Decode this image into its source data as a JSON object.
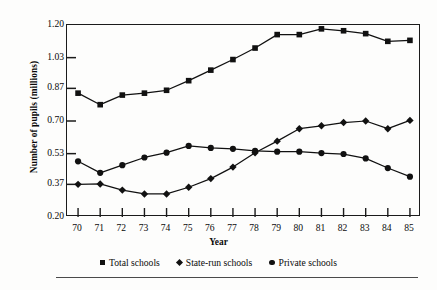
{
  "figure": {
    "ylabel": "Number of pupils (millions)",
    "xlabel": "Year"
  },
  "legend": [
    {
      "label": "Total schools",
      "marker": "square-marker-icon",
      "color": "#111111"
    },
    {
      "label": "State-run schools",
      "marker": "diamond-marker-icon",
      "color": "#111111"
    },
    {
      "label": "Private schools",
      "marker": "circle-marker-icon",
      "color": "#111111"
    }
  ],
  "axis": {
    "yticks": [
      "1.20",
      "1.03",
      "0.87",
      "0.70",
      "0.53",
      "0.37",
      "0.20"
    ],
    "ytick_values": [
      1.2,
      1.03,
      0.87,
      0.7,
      0.53,
      0.37,
      0.2
    ],
    "xticks": [
      "70",
      "71",
      "72",
      "73",
      "74",
      "75",
      "76",
      "77",
      "78",
      "79",
      "80",
      "81",
      "82",
      "83",
      "84",
      "85"
    ]
  },
  "chart_data": {
    "type": "line",
    "title": "",
    "xlabel": "Year",
    "ylabel": "Number of pupils (millions)",
    "categories": [
      "70",
      "71",
      "72",
      "73",
      "74",
      "75",
      "76",
      "77",
      "78",
      "79",
      "80",
      "81",
      "82",
      "83",
      "84",
      "85"
    ],
    "x": [
      70,
      71,
      72,
      73,
      74,
      75,
      76,
      77,
      78,
      79,
      80,
      81,
      82,
      83,
      84,
      85
    ],
    "ylim": [
      0.2,
      1.2
    ],
    "xlim": [
      69.5,
      85.5
    ],
    "grid": false,
    "legend_position": "below-axes",
    "series": [
      {
        "name": "Total schools",
        "marker": "square",
        "color": "#111111",
        "values": [
          0.845,
          0.785,
          0.835,
          0.845,
          0.86,
          0.91,
          0.965,
          1.02,
          1.08,
          1.15,
          1.15,
          1.18,
          1.17,
          1.155,
          1.115,
          1.12
        ]
      },
      {
        "name": "State-run schools",
        "marker": "diamond",
        "color": "#111111",
        "values": [
          0.37,
          0.372,
          0.34,
          0.32,
          0.32,
          0.355,
          0.4,
          0.46,
          0.535,
          0.595,
          0.66,
          0.675,
          0.692,
          0.7,
          0.66,
          0.703
        ]
      },
      {
        "name": "Private schools",
        "marker": "circle",
        "color": "#111111",
        "values": [
          0.49,
          0.43,
          0.47,
          0.51,
          0.535,
          0.57,
          0.56,
          0.555,
          0.545,
          0.54,
          0.54,
          0.533,
          0.528,
          0.505,
          0.455,
          0.41
        ]
      }
    ]
  }
}
